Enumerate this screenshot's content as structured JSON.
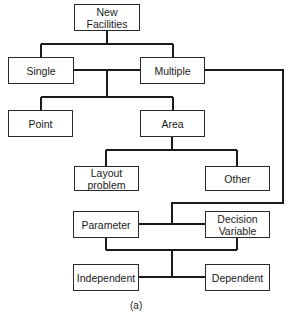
{
  "diagram": {
    "type": "hierarchy-flowchart",
    "nodes": {
      "new_facilities": "New Facilities",
      "single": "Single",
      "multiple": "Multiple",
      "point": "Point",
      "area": "Area",
      "layout_problem_1": "Layout",
      "layout_problem_2": "problem",
      "other": "Other",
      "parameter": "Parameter",
      "decision_variable_1": "Decision",
      "decision_variable_2": "Variable",
      "independent": "Independent",
      "dependent": "Dependent"
    },
    "edges": [
      [
        "New Facilities",
        "Single"
      ],
      [
        "New Facilities",
        "Multiple"
      ],
      [
        "Single",
        "Point"
      ],
      [
        "Single",
        "Area"
      ],
      [
        "Multiple",
        "Point"
      ],
      [
        "Multiple",
        "Area"
      ],
      [
        "Area",
        "Layout problem"
      ],
      [
        "Area",
        "Other"
      ],
      [
        "Multiple",
        "Parameter"
      ],
      [
        "Multiple",
        "Decision Variable"
      ],
      [
        "Parameter",
        "Independent"
      ],
      [
        "Parameter",
        "Dependent"
      ],
      [
        "Decision Variable",
        "Independent"
      ],
      [
        "Decision Variable",
        "Dependent"
      ]
    ],
    "caption": "(a)",
    "line_color": "#1a1a1a",
    "box_border_color": "#2a2a2a"
  }
}
